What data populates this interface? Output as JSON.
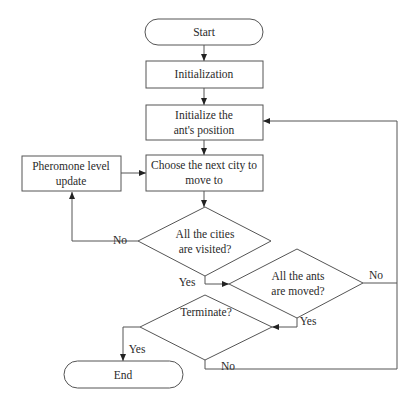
{
  "diagram": {
    "type": "flowchart",
    "nodes": {
      "start": {
        "label": "Start",
        "shape": "terminator"
      },
      "init": {
        "label": "Initialization",
        "shape": "process"
      },
      "init_pos": {
        "line1": "Initialize the",
        "line2": "ant's position",
        "shape": "process"
      },
      "choose": {
        "line1": "Choose the next city to",
        "line2": "move to",
        "shape": "process"
      },
      "pheromone": {
        "line1": "Pheromone level",
        "line2": "update",
        "shape": "process"
      },
      "cities_visited": {
        "line1": "All the cities",
        "line2": "are visited?",
        "shape": "decision"
      },
      "ants_moved": {
        "line1": "All the ants",
        "line2": "are moved?",
        "shape": "decision"
      },
      "terminate": {
        "label": "Terminate?",
        "shape": "decision"
      },
      "end": {
        "label": "End",
        "shape": "terminator"
      }
    },
    "edge_labels": {
      "cities_no": "No",
      "cities_yes": "Yes",
      "ants_no": "No",
      "ants_yes": "Yes",
      "terminate_yes": "Yes",
      "terminate_no": "No"
    },
    "edges": [
      {
        "from": "start",
        "to": "init"
      },
      {
        "from": "init",
        "to": "init_pos"
      },
      {
        "from": "init_pos",
        "to": "choose"
      },
      {
        "from": "choose",
        "to": "cities_visited"
      },
      {
        "from": "cities_visited",
        "to": "pheromone",
        "label": "No"
      },
      {
        "from": "pheromone",
        "to": "choose"
      },
      {
        "from": "cities_visited",
        "to": "ants_moved",
        "label": "Yes"
      },
      {
        "from": "ants_moved",
        "to": "init_pos",
        "label": "No"
      },
      {
        "from": "ants_moved",
        "to": "terminate",
        "label": "Yes"
      },
      {
        "from": "terminate",
        "to": "end",
        "label": "Yes"
      },
      {
        "from": "terminate",
        "to": "init_pos",
        "label": "No"
      }
    ]
  }
}
